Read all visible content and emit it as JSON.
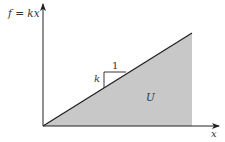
{
  "diagram": {
    "y_axis_label": "f = kx",
    "x_axis_label": "x",
    "slope_run_label": "1",
    "slope_rise_label": "k",
    "area_label": "U",
    "colors": {
      "axis": "#222222",
      "line": "#222222",
      "fill": "#c8c8c8",
      "text": "#333333",
      "background": "#ffffff"
    },
    "geometry": {
      "origin": [
        43,
        126
      ],
      "y_axis_top": [
        43,
        3
      ],
      "x_axis_end": [
        220,
        126
      ],
      "line_end": [
        192,
        33
      ],
      "shaded_right_x": 192
    }
  }
}
